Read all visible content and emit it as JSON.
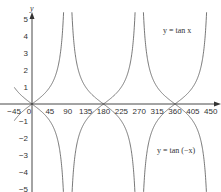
{
  "chart_data": {
    "type": "line",
    "title": "",
    "xlabel": "",
    "ylabel": "y",
    "xlim": [
      -45,
      450
    ],
    "ylim": [
      -5,
      5
    ],
    "x_ticks": [
      -45,
      0,
      45,
      90,
      135,
      180,
      225,
      270,
      315,
      360,
      405,
      450
    ],
    "y_ticks": [
      -5,
      -4,
      -3,
      -2,
      -1,
      1,
      2,
      3,
      4,
      5
    ],
    "grid": false,
    "series": [
      {
        "name": "y = tan x",
        "function": "tan(x)",
        "asymptotes": [
          90,
          270,
          450
        ]
      },
      {
        "name": "y = tan (−x)",
        "function": "tan(-x)",
        "asymptotes": [
          90,
          270,
          450
        ]
      }
    ],
    "annotations": [
      {
        "text": "y = tan x",
        "x": 405,
        "y": 4
      },
      {
        "text": "y = tan (−x)",
        "x": 405,
        "y": -3
      }
    ]
  },
  "labels": {
    "y_axis": "y",
    "curve1": "y = tan x",
    "curve2": "y = tan (−x)"
  }
}
